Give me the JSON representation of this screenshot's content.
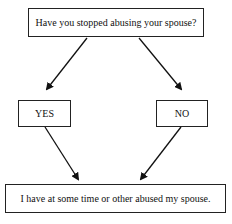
{
  "diagram": {
    "question": "Have you stopped abusing your spouse?",
    "yes_label": "YES",
    "no_label": "NO",
    "conclusion": "I have at some time or other abused my spouse."
  }
}
